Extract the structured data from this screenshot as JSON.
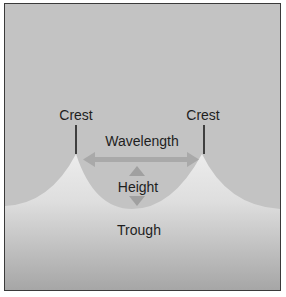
{
  "diagram": {
    "type": "wave-anatomy",
    "labels": {
      "crest_left": "Crest",
      "crest_right": "Crest",
      "wavelength": "Wavelength",
      "height": "Height",
      "trough": "Trough"
    },
    "colors": {
      "sky": "#c3c3c3",
      "water_top": "#ececec",
      "water_bottom": "#a6a6a6",
      "arrow": "#a9a9a9",
      "marker_line": "#1e1e1e",
      "border": "#3a3a3a"
    }
  }
}
